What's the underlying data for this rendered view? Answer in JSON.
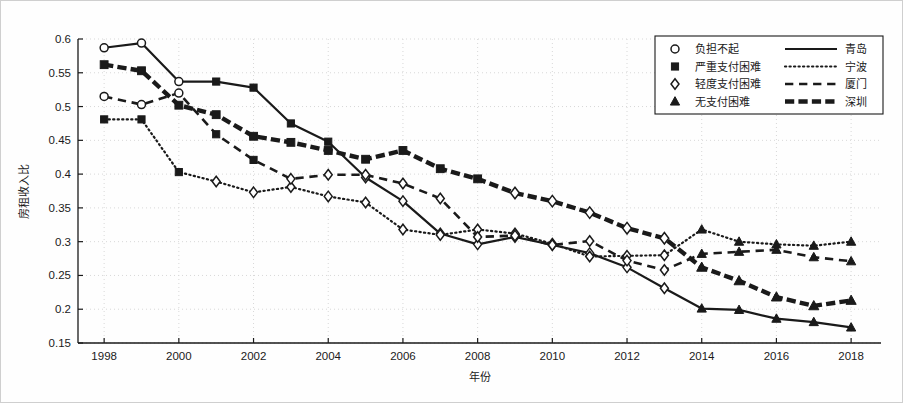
{
  "chart_data": {
    "type": "line",
    "title": "",
    "xlabel": "年份",
    "ylabel": "房租收入比",
    "xlim": [
      1997.3,
      2018.8
    ],
    "ylim": [
      0.15,
      0.6
    ],
    "grid": true,
    "legend_position": "top-right",
    "x": [
      1998,
      1999,
      2000,
      2001,
      2002,
      2003,
      2004,
      2005,
      2006,
      2007,
      2008,
      2009,
      2010,
      2011,
      2012,
      2013,
      2014,
      2015,
      2016,
      2017,
      2018
    ],
    "xticks": [
      1998,
      2000,
      2002,
      2004,
      2006,
      2008,
      2010,
      2012,
      2014,
      2016,
      2018
    ],
    "yticks": [
      0.15,
      0.2,
      0.25,
      0.3,
      0.35,
      0.4,
      0.45,
      0.5,
      0.55,
      0.6
    ],
    "marker_legend": [
      {
        "marker": "circle",
        "label": "负担不起"
      },
      {
        "marker": "square",
        "label": "严重支付困难"
      },
      {
        "marker": "diamond",
        "label": "轻度支付困难"
      },
      {
        "marker": "triangle",
        "label": "无支付困难"
      }
    ],
    "series": [
      {
        "name": "青岛",
        "line_style": "solid",
        "line_width": 2.2,
        "values": [
          0.587,
          0.594,
          0.537,
          0.537,
          0.528,
          0.475,
          0.448,
          0.395,
          0.36,
          0.312,
          0.296,
          0.307,
          0.295,
          0.283,
          0.262,
          0.231,
          0.201,
          0.199,
          0.186,
          0.181,
          0.173
        ],
        "markers": [
          "circle",
          "circle",
          "circle",
          "square",
          "square",
          "square",
          "square",
          "diamond",
          "diamond",
          "diamond",
          "diamond",
          "diamond",
          "diamond",
          "diamond",
          "diamond",
          "diamond",
          "triangle",
          "triangle",
          "triangle",
          "triangle",
          "triangle"
        ]
      },
      {
        "name": "宁波",
        "line_style": "dotted",
        "line_width": 2.2,
        "values": [
          0.481,
          0.481,
          0.403,
          0.389,
          0.373,
          0.381,
          0.367,
          0.358,
          0.318,
          0.31,
          0.318,
          0.312,
          0.297,
          0.278,
          0.279,
          0.28,
          0.318,
          0.3,
          0.296,
          0.294,
          0.3
        ],
        "markers": [
          "square",
          "square",
          "square",
          "diamond",
          "diamond",
          "diamond",
          "diamond",
          "diamond",
          "diamond",
          "diamond",
          "diamond",
          "diamond",
          "diamond",
          "diamond",
          "diamond",
          "diamond",
          "triangle",
          "triangle",
          "triangle",
          "triangle",
          "triangle"
        ]
      },
      {
        "name": "厦门",
        "line_style": "dashed",
        "line_width": 2.6,
        "values": [
          0.515,
          0.503,
          0.52,
          0.459,
          0.421,
          0.393,
          0.399,
          0.399,
          0.386,
          0.364,
          0.307,
          0.309,
          0.295,
          0.301,
          0.272,
          0.258,
          0.282,
          0.285,
          0.288,
          0.277,
          0.271
        ],
        "markers": [
          "circle",
          "circle",
          "circle",
          "square",
          "square",
          "diamond",
          "diamond",
          "diamond",
          "diamond",
          "diamond",
          "diamond",
          "diamond",
          "diamond",
          "diamond",
          "diamond",
          "diamond",
          "triangle",
          "triangle",
          "triangle",
          "triangle",
          "triangle"
        ]
      },
      {
        "name": "深圳",
        "line_style": "thick-dash",
        "line_width": 4.4,
        "values": [
          0.562,
          0.553,
          0.502,
          0.488,
          0.456,
          0.447,
          0.435,
          0.422,
          0.435,
          0.408,
          0.393,
          0.372,
          0.36,
          0.343,
          0.32,
          0.305,
          0.262,
          0.242,
          0.218,
          0.205,
          0.213
        ],
        "markers": [
          "square",
          "square",
          "square",
          "square",
          "square",
          "square",
          "square",
          "square",
          "square",
          "square",
          "square",
          "diamond",
          "diamond",
          "diamond",
          "diamond",
          "diamond",
          "triangle",
          "triangle",
          "triangle",
          "triangle",
          "triangle"
        ]
      }
    ]
  },
  "legend": {
    "rows": [
      {
        "marker": "circle",
        "marker_label": "负担不起",
        "line_style": "solid",
        "city": "青岛"
      },
      {
        "marker": "square",
        "marker_label": "严重支付困难",
        "line_style": "dotted",
        "city": "宁波"
      },
      {
        "marker": "diamond",
        "marker_label": "轻度支付困难",
        "line_style": "dashed",
        "city": "厦门"
      },
      {
        "marker": "triangle",
        "marker_label": "无支付困难",
        "line_style": "thick-dash",
        "city": "深圳"
      }
    ]
  },
  "colors": {
    "ink": "#1a1a1a",
    "grid": "#d8d8d8",
    "background": "#fefefe"
  }
}
